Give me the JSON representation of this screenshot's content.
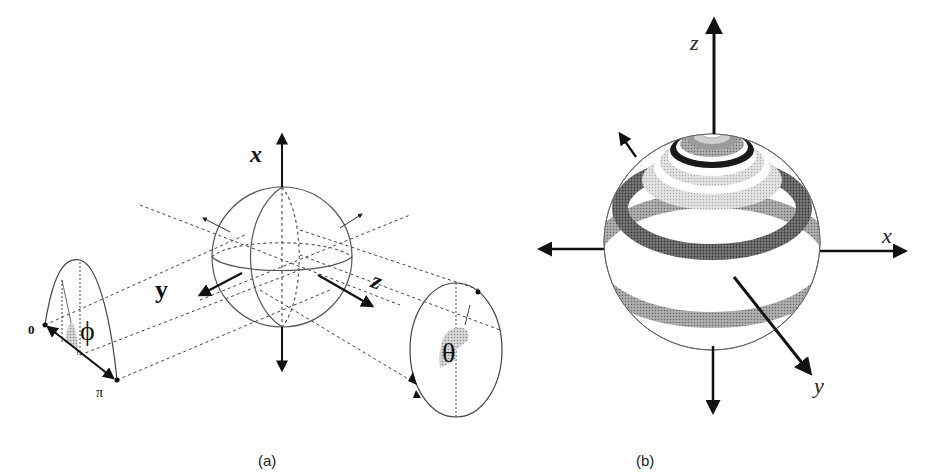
{
  "panel_a": {
    "caption": "(a)",
    "axis_labels": {
      "x": "x",
      "y": "y",
      "z": "z"
    },
    "phi_label": "ϕ",
    "theta_label": "θ",
    "phi_range_start": "0",
    "phi_range_end": "π"
  },
  "panel_b": {
    "caption": "(b)",
    "axis_labels": {
      "x": "x",
      "y": "y",
      "z": "z"
    }
  },
  "colors": {
    "ink": "#111111",
    "line": "#555555",
    "band_dark": "#6e6e6e",
    "band_mid": "#9a9a9a",
    "band_light": "#c8c8c8",
    "band_black": "#1a1a1a"
  }
}
